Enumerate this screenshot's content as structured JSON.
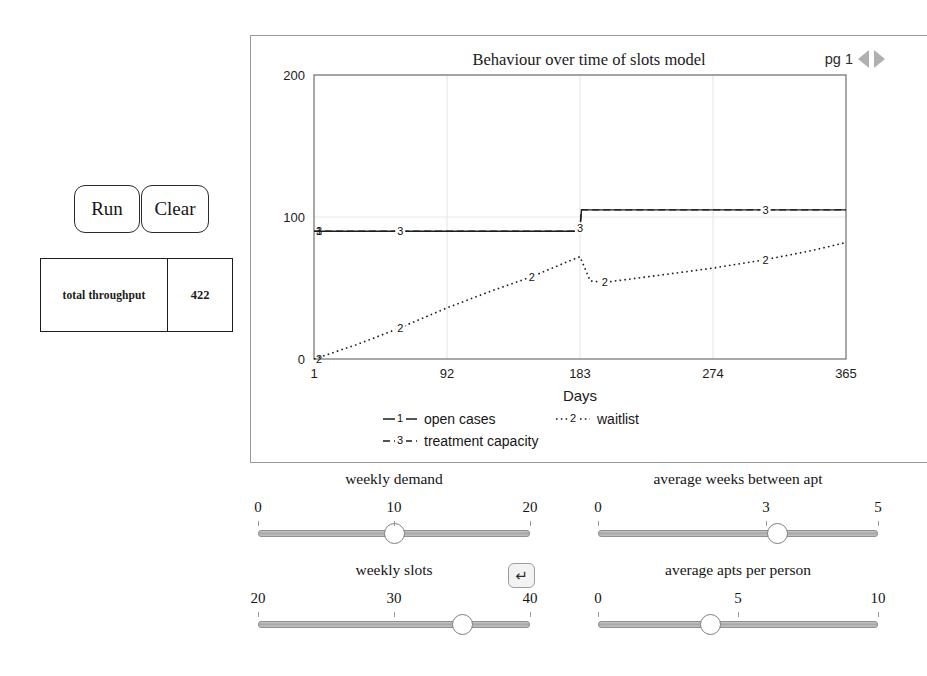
{
  "controls": {
    "run_label": "Run",
    "clear_label": "Clear",
    "reset_icon": "return-arrow-icon",
    "reset_glyph": "↵"
  },
  "throughput": {
    "label": "total throughput",
    "value": "422"
  },
  "chart_panel": {
    "page_label": "pg 1",
    "prev_icon": "left-triangle-icon",
    "next_icon": "right-triangle-icon"
  },
  "chart_data": {
    "type": "line",
    "title": "Behaviour over time of slots model",
    "xlabel": "Days",
    "ylabel": "",
    "xlim": [
      1,
      365
    ],
    "ylim": [
      0,
      200
    ],
    "xticks": [
      "1",
      "92",
      "183",
      "274",
      "365"
    ],
    "xtick_values": [
      1,
      92,
      183,
      274,
      365
    ],
    "yticks": [
      "0",
      "100",
      "200"
    ],
    "ytick_values": [
      0,
      100,
      200
    ],
    "grid": true,
    "legend_position": "below",
    "series": [
      {
        "name": "open cases",
        "marker": "1",
        "style": "solid",
        "legend": "open cases",
        "x": [
          1,
          60,
          120,
          182,
          183,
          184,
          250,
          310,
          365
        ],
        "y": [
          90,
          90,
          90,
          90,
          92,
          105,
          105,
          105,
          105
        ]
      },
      {
        "name": "waitlist",
        "marker": "2",
        "style": "dotted",
        "legend": "waitlist",
        "x": [
          1,
          30,
          60,
          92,
          120,
          150,
          178,
          183,
          190,
          200,
          230,
          274,
          310,
          340,
          365
        ],
        "y": [
          0,
          10,
          22,
          36,
          47,
          58,
          70,
          72,
          55,
          54,
          58,
          64,
          70,
          76,
          82
        ]
      },
      {
        "name": "treatment capacity",
        "marker": "3",
        "style": "dashed",
        "legend": "treatment capacity",
        "x": [
          1,
          60,
          120,
          182,
          183,
          184,
          250,
          310,
          365
        ],
        "y": [
          90,
          90,
          90,
          90,
          92,
          105,
          105,
          105,
          105
        ]
      }
    ]
  },
  "sliders": [
    {
      "id": "weekly-demand",
      "title": "weekly demand",
      "min": 0,
      "max": 20,
      "value": 10,
      "ticklabels": [
        "0",
        "10",
        "20"
      ],
      "tickvalues": [
        0,
        10,
        20
      ]
    },
    {
      "id": "average-weeks-between-apt",
      "title": "average weeks between apt",
      "min": 0,
      "max": 5,
      "value": 3.2,
      "ticklabels": [
        "0",
        "3",
        "5"
      ],
      "tickvalues": [
        0,
        3,
        5
      ]
    },
    {
      "id": "weekly-slots",
      "title": "weekly slots",
      "min": 20,
      "max": 40,
      "value": 35,
      "ticklabels": [
        "20",
        "30",
        "40"
      ],
      "tickvalues": [
        20,
        30,
        40
      ]
    },
    {
      "id": "average-apts-per-person",
      "title": "average apts per person",
      "min": 0,
      "max": 10,
      "value": 4,
      "ticklabels": [
        "0",
        "5",
        "10"
      ],
      "tickvalues": [
        0,
        5,
        10
      ]
    }
  ]
}
